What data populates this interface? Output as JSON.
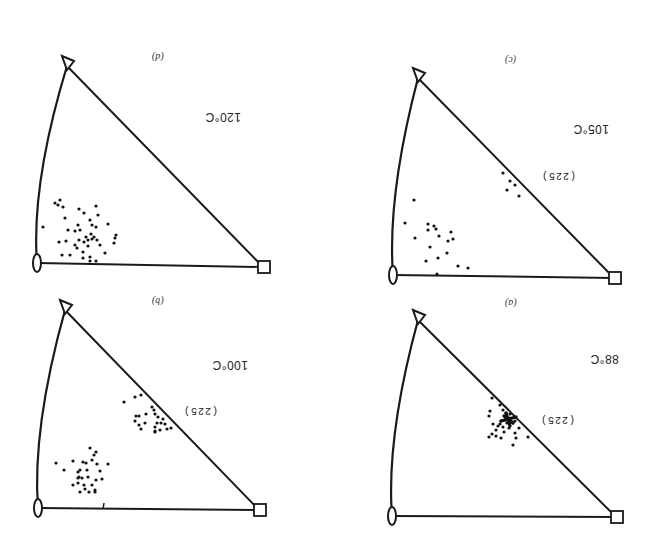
{
  "figure": {
    "orientation": "rotated-180",
    "panels": [
      {
        "id": "d",
        "label": "(d)",
        "temperature": "120°C",
        "pole_annotation": "",
        "vertices": {
          "triangle": [
            67,
            66
          ],
          "lens": [
            37,
            263
          ],
          "square": [
            263,
            267
          ]
        },
        "label_pos": [
          152,
          52
        ],
        "temp_pos": [
          205,
          110
        ],
        "points": [
          [
            55,
            203
          ],
          [
            60,
            200
          ],
          [
            63,
            207
          ],
          [
            65,
            218
          ],
          [
            58,
            205
          ],
          [
            79,
            209
          ],
          [
            84,
            213
          ],
          [
            96,
            206
          ],
          [
            98,
            215
          ],
          [
            90,
            220
          ],
          [
            92,
            225
          ],
          [
            78,
            225
          ],
          [
            80,
            230
          ],
          [
            75,
            231
          ],
          [
            68,
            230
          ],
          [
            91,
            234
          ],
          [
            96,
            227
          ],
          [
            108,
            224
          ],
          [
            116,
            235
          ],
          [
            115,
            238
          ],
          [
            114,
            243
          ],
          [
            88,
            240
          ],
          [
            86,
            237
          ],
          [
            84,
            242
          ],
          [
            79,
            240
          ],
          [
            75,
            245
          ],
          [
            66,
            241
          ],
          [
            59,
            242
          ],
          [
            97,
            240
          ],
          [
            94,
            237
          ],
          [
            92,
            239
          ],
          [
            100,
            245
          ],
          [
            77,
            248
          ],
          [
            88,
            246
          ],
          [
            105,
            253
          ],
          [
            62,
            255
          ],
          [
            70,
            255
          ],
          [
            83,
            252
          ],
          [
            90,
            257
          ],
          [
            83,
            258
          ],
          [
            90,
            261
          ],
          [
            96,
            261
          ],
          [
            43,
            227
          ]
        ]
      },
      {
        "id": "c",
        "label": "(c)",
        "temperature": "105°C",
        "pole_annotation": "(225)",
        "vertices": {
          "triangle": [
            418,
            78
          ],
          "lens": [
            393,
            275
          ],
          "square": [
            614,
            278
          ]
        },
        "label_pos": [
          505,
          55
        ],
        "temp_pos": [
          573,
          122
        ],
        "pole_pos": [
          541,
          170
        ],
        "points": [
          [
            503,
            173
          ],
          [
            510,
            181
          ],
          [
            515,
            185
          ],
          [
            507,
            190
          ],
          [
            519,
            196
          ],
          [
            414,
            200
          ],
          [
            405,
            223
          ],
          [
            428,
            224
          ],
          [
            434,
            226
          ],
          [
            436,
            229
          ],
          [
            428,
            230
          ],
          [
            415,
            238
          ],
          [
            439,
            236
          ],
          [
            451,
            232
          ],
          [
            448,
            241
          ],
          [
            453,
            239
          ],
          [
            430,
            247
          ],
          [
            447,
            253
          ],
          [
            426,
            261
          ],
          [
            438,
            258
          ],
          [
            458,
            266
          ],
          [
            468,
            268
          ],
          [
            437,
            274
          ]
        ]
      },
      {
        "id": "b",
        "label": "(b)",
        "temperature": "100°C",
        "pole_annotation": "(225)",
        "vertices": {
          "triangle": [
            65,
            310
          ],
          "lens": [
            38,
            508
          ],
          "square": [
            259,
            510
          ]
        },
        "label_pos": [
          152,
          296
        ],
        "temp_pos": [
          212,
          358
        ],
        "pole_pos": [
          183,
          405
        ],
        "points": [
          [
            124,
            402
          ],
          [
            135,
            397
          ],
          [
            141,
            395
          ],
          [
            152,
            407
          ],
          [
            154,
            410
          ],
          [
            155,
            414
          ],
          [
            136,
            416
          ],
          [
            139,
            416
          ],
          [
            146,
            414
          ],
          [
            158,
            417
          ],
          [
            163,
            419
          ],
          [
            161,
            423
          ],
          [
            165,
            424
          ],
          [
            157,
            423
          ],
          [
            135,
            421
          ],
          [
            139,
            425
          ],
          [
            145,
            423
          ],
          [
            155,
            427
          ],
          [
            141,
            429
          ],
          [
            155,
            431
          ],
          [
            160,
            430
          ],
          [
            167,
            429
          ],
          [
            171,
            428
          ],
          [
            155,
            432
          ],
          [
            90,
            448
          ],
          [
            96,
            452
          ],
          [
            94,
            455
          ],
          [
            83,
            462
          ],
          [
            73,
            461
          ],
          [
            92,
            460
          ],
          [
            86,
            463
          ],
          [
            97,
            464
          ],
          [
            108,
            464
          ],
          [
            56,
            463
          ],
          [
            64,
            470
          ],
          [
            80,
            470
          ],
          [
            78,
            472
          ],
          [
            87,
            470
          ],
          [
            100,
            471
          ],
          [
            78,
            478
          ],
          [
            79,
            477
          ],
          [
            82,
            478
          ],
          [
            88,
            477
          ],
          [
            102,
            479
          ],
          [
            96,
            480
          ],
          [
            73,
            485
          ],
          [
            78,
            483
          ],
          [
            84,
            485
          ],
          [
            92,
            485
          ],
          [
            80,
            492
          ],
          [
            95,
            492
          ],
          [
            89,
            492
          ],
          [
            95,
            490
          ],
          [
            85,
            489
          ]
        ]
      },
      {
        "id": "a",
        "label": "(a)",
        "temperature": "88°C",
        "pole_annotation": "(225)",
        "vertices": {
          "triangle": [
            418,
            320
          ],
          "lens": [
            392,
            516
          ],
          "square": [
            616,
            517
          ]
        },
        "label_pos": [
          505,
          298
        ],
        "temp_pos": [
          590,
          352
        ],
        "pole_pos": [
          540,
          414
        ],
        "points": [
          [
            492,
            398
          ],
          [
            500,
            405
          ],
          [
            490,
            411
          ],
          [
            489,
            416
          ],
          [
            503,
            410
          ],
          [
            506,
            413
          ],
          [
            510,
            414
          ],
          [
            509,
            418
          ],
          [
            505,
            420
          ],
          [
            501,
            421
          ],
          [
            511,
            421
          ],
          [
            507,
            423
          ],
          [
            513,
            423
          ],
          [
            515,
            421
          ],
          [
            500,
            424
          ],
          [
            493,
            424
          ],
          [
            498,
            426
          ],
          [
            503,
            427
          ],
          [
            509,
            428
          ],
          [
            519,
            428
          ],
          [
            496,
            430
          ],
          [
            492,
            434
          ],
          [
            504,
            432
          ],
          [
            515,
            433
          ],
          [
            489,
            437
          ],
          [
            496,
            436
          ],
          [
            501,
            438
          ],
          [
            516,
            438
          ],
          [
            528,
            437
          ],
          [
            513,
            445
          ]
        ],
        "cluster_center": [
          508,
          419
        ]
      }
    ]
  },
  "chart_data": {
    "type": "scatter",
    "xlabel": "",
    "ylabel": "",
    "series": [
      {
        "name": "(a) 88°C",
        "note": "tight cluster at (225) pole"
      },
      {
        "name": "(b) 100°C",
        "note": "two clusters: near (225) and near lower-left"
      },
      {
        "name": "(c) 105°C",
        "note": "small group near (225), main spread lower-left"
      },
      {
        "name": "(d) 120°C",
        "note": "single broad cluster lower-left near lens vertex"
      }
    ],
    "annotations": [
      "(225)",
      "88°C",
      "100°C",
      "105°C",
      "120°C",
      "(a)",
      "(b)",
      "(c)",
      "(d)"
    ],
    "grid": false
  }
}
